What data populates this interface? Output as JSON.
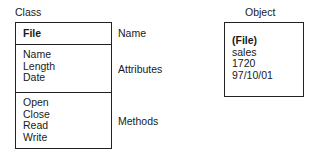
{
  "class_diagram": {
    "heading": "Class",
    "name_section": {
      "value": "File",
      "annotation": "Name"
    },
    "attributes_section": {
      "values": [
        "Name",
        "Length",
        "Date"
      ],
      "annotation": "Attributes"
    },
    "methods_section": {
      "values": [
        "Open",
        "Close",
        "Read",
        "Write"
      ],
      "annotation": "Methods"
    }
  },
  "object_diagram": {
    "heading": "Object",
    "class_name": "(File)",
    "values": [
      "sales",
      "1720",
      "97/10/01"
    ]
  }
}
